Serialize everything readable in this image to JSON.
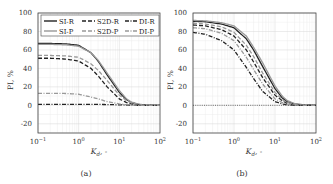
{
  "chart_data": [
    {
      "panel": "(a)",
      "type": "line",
      "xscale": "log",
      "xlim": [
        0.1,
        100
      ],
      "ylim": [
        -30,
        100
      ],
      "xlabel": "K_d, -",
      "ylabel": "PI, %",
      "xticks": [
        "10^-1",
        "10^0",
        "10^1",
        "10^2"
      ],
      "yticks": [
        -20,
        0,
        20,
        40,
        60,
        80,
        100
      ],
      "grid": true,
      "legend": {
        "position": "top",
        "columns": 3,
        "entries": [
          "SI-R",
          "S2D-R",
          "DI-R",
          "SI-P",
          "S2D-P",
          "DI-P"
        ]
      },
      "x": [
        0.1,
        0.2,
        0.5,
        1,
        2,
        3,
        5,
        10,
        15,
        20,
        30,
        50,
        100
      ],
      "series": [
        {
          "name": "SI-R",
          "style": "solid",
          "color": "#222222",
          "values": [
            67,
            67,
            66.5,
            65,
            57,
            48,
            33,
            14,
            6,
            3,
            1,
            0,
            0
          ]
        },
        {
          "name": "SI-P",
          "style": "solid",
          "color": "#999999",
          "values": [
            66,
            66,
            65.5,
            64,
            57,
            49,
            35,
            16,
            7,
            3.5,
            1.2,
            0.3,
            0
          ]
        },
        {
          "name": "S2D-R",
          "style": "dashed",
          "color": "#222222",
          "values": [
            51,
            51,
            50,
            48,
            40,
            32,
            20,
            7,
            3,
            1.5,
            0.5,
            0,
            0
          ]
        },
        {
          "name": "S2D-P",
          "style": "dashed",
          "color": "#999999",
          "values": [
            54,
            54,
            53.5,
            52,
            45,
            38,
            27,
            11,
            5,
            2.5,
            0.8,
            0.2,
            0
          ]
        },
        {
          "name": "DI-R",
          "style": "dashdot",
          "color": "#222222",
          "values": [
            1,
            1,
            1,
            1,
            1,
            1,
            0.8,
            0.5,
            0.3,
            0.2,
            0,
            0,
            0
          ]
        },
        {
          "name": "DI-P",
          "style": "dashdot",
          "color": "#999999",
          "values": [
            13,
            13,
            12.8,
            12,
            9,
            7,
            4,
            1.5,
            0.6,
            0.3,
            0,
            0,
            0
          ]
        }
      ]
    },
    {
      "panel": "(b)",
      "type": "line",
      "xscale": "log",
      "xlim": [
        0.1,
        100
      ],
      "ylim": [
        -30,
        100
      ],
      "xlabel": "K_d, -",
      "ylabel": "PI, %",
      "xticks": [
        "10^-1",
        "10^0",
        "10^1",
        "10^2"
      ],
      "yticks": [
        -20,
        0,
        20,
        40,
        60,
        80,
        100
      ],
      "grid": true,
      "legend": null,
      "x": [
        0.1,
        0.2,
        0.5,
        1,
        2,
        3,
        5,
        10,
        15,
        20,
        30,
        50,
        100
      ],
      "series": [
        {
          "name": "SI-R",
          "style": "solid",
          "color": "#222222",
          "values": [
            91,
            90.5,
            88,
            84,
            72,
            60,
            42,
            18,
            8,
            4,
            1.5,
            0.3,
            0
          ]
        },
        {
          "name": "SI-P",
          "style": "solid",
          "color": "#999999",
          "values": [
            92,
            91.5,
            89.5,
            86,
            75,
            63,
            46,
            21,
            10,
            5,
            2,
            0.5,
            0
          ]
        },
        {
          "name": "S2D-R",
          "style": "dashed",
          "color": "#222222",
          "values": [
            87,
            86,
            82,
            75,
            60,
            47,
            30,
            11,
            5,
            2,
            0.7,
            0,
            0
          ]
        },
        {
          "name": "S2D-P",
          "style": "dashed",
          "color": "#999999",
          "values": [
            89,
            88,
            85,
            79,
            65,
            53,
            35,
            14,
            6,
            3,
            1,
            0.2,
            0
          ]
        },
        {
          "name": "DI-R",
          "style": "dashdot",
          "color": "#222222",
          "values": [
            79,
            77,
            70,
            60,
            41,
            29,
            15,
            4,
            1.5,
            0.5,
            0,
            0,
            0
          ]
        },
        {
          "name": "DI-P",
          "style": "dashdot",
          "color": "#999999",
          "values": [
            84,
            83,
            78,
            70,
            52,
            39,
            23,
            7,
            3,
            1.2,
            0.3,
            0,
            0
          ]
        }
      ]
    }
  ],
  "panels": {
    "a": {
      "caption": "(a)",
      "ylabel": "PI, %",
      "xlabel": "K_d, -"
    },
    "b": {
      "caption": "(b)",
      "ylabel": "PI, %",
      "xlabel": "K_d, -"
    }
  },
  "legend": {
    "row1": [
      "SI-R",
      "S2D-R",
      "DI-R"
    ],
    "row2": [
      "SI-P",
      "S2D-P",
      "DI-P"
    ]
  },
  "colors": {
    "dark": "#222222",
    "light": "#999999",
    "grid": "#e3e3e3",
    "frame": "#444444"
  }
}
